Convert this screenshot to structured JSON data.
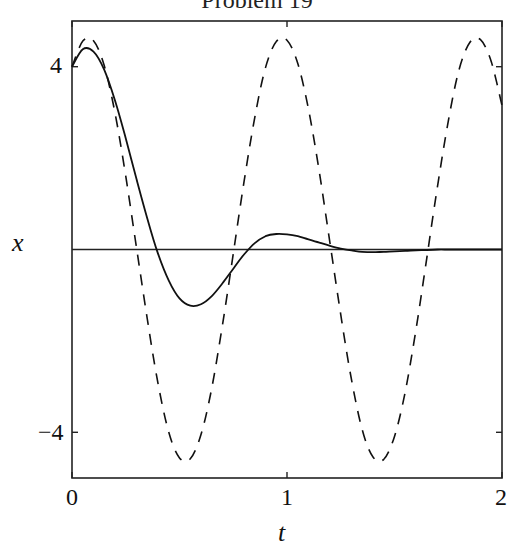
{
  "chart_data": {
    "type": "line",
    "title": "Problem 19",
    "xlabel": "t",
    "ylabel": "x",
    "xlim": [
      0,
      2
    ],
    "ylim": [
      -5,
      5
    ],
    "xticks": [
      0,
      1,
      2
    ],
    "xtick_labels": [
      "0",
      "1",
      "2"
    ],
    "yticks": [
      -4,
      4
    ],
    "ytick_labels": [
      "−4",
      "4"
    ],
    "grid": false,
    "legend": null,
    "zero_line": true,
    "series": [
      {
        "name": "damped",
        "style": "solid",
        "x": [
          0,
          0.05,
          0.1,
          0.15,
          0.2,
          0.25,
          0.3,
          0.35,
          0.4,
          0.45,
          0.5,
          0.55,
          0.6,
          0.65,
          0.7,
          0.75,
          0.8,
          0.85,
          0.9,
          0.95,
          1.0,
          1.05,
          1.1,
          1.15,
          1.2,
          1.25,
          1.3,
          1.35,
          1.4,
          1.45,
          1.5,
          1.55,
          1.6,
          1.65,
          1.7,
          1.75,
          1.8,
          1.85,
          1.9,
          1.95,
          2.0
        ],
        "y": [
          4.0,
          4.38,
          4.33,
          3.93,
          3.26,
          2.43,
          1.54,
          0.68,
          -0.09,
          -0.68,
          -1.07,
          -1.23,
          -1.2,
          -1.02,
          -0.74,
          -0.42,
          -0.11,
          0.14,
          0.29,
          0.34,
          0.33,
          0.29,
          0.22,
          0.15,
          0.08,
          0.02,
          -0.02,
          -0.05,
          -0.06,
          -0.05,
          -0.04,
          -0.03,
          -0.02,
          -0.01,
          0.0,
          0.0,
          0.0,
          0.0,
          0.0,
          0.0,
          0.0
        ]
      },
      {
        "name": "undamped",
        "style": "dashed",
        "x": [
          0,
          0.05,
          0.1,
          0.15,
          0.2,
          0.25,
          0.3,
          0.35,
          0.4,
          0.45,
          0.5,
          0.55,
          0.6,
          0.65,
          0.7,
          0.75,
          0.8,
          0.85,
          0.9,
          0.95,
          1.0,
          1.05,
          1.1,
          1.15,
          1.2,
          1.25,
          1.3,
          1.35,
          1.4,
          1.45,
          1.5,
          1.55,
          1.6,
          1.65,
          1.7,
          1.75,
          1.8,
          1.85,
          1.9,
          1.95,
          2.0
        ],
        "y": [
          4.0,
          4.56,
          4.57,
          4.02,
          2.99,
          1.6,
          0.04,
          -1.52,
          -2.93,
          -4.0,
          -4.56,
          -4.58,
          -4.05,
          -3.03,
          -1.65,
          -0.09,
          1.48,
          2.89,
          3.98,
          4.55,
          4.58,
          4.07,
          3.07,
          1.7,
          0.14,
          -1.43,
          -2.85,
          -3.95,
          -4.54,
          -4.59,
          -4.09,
          -3.11,
          -1.75,
          -0.19,
          1.38,
          2.81,
          3.93,
          4.53,
          4.59,
          4.11,
          3.15
        ]
      }
    ]
  }
}
